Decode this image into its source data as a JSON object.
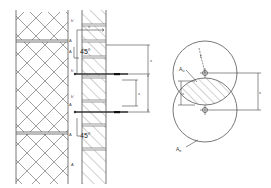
{
  "diagram": {
    "left_section": {
      "angle_labels": [
        "45°",
        "45°"
      ],
      "dimension_labels": {
        "top_spacing": "s",
        "right_vertical": "s",
        "inner_vertical": "s"
      },
      "side_labels": [
        "h'",
        "A",
        "A",
        "h'",
        "h'",
        "A",
        "A",
        "A"
      ]
    },
    "right_section": {
      "radius_label": "r",
      "overlap_label": "A",
      "overlap_sub": "ü",
      "circle_label": "A",
      "circle_sub": "e",
      "left_dim_label": "x",
      "right_dim_label": "s"
    },
    "colors": {
      "line": "#555555",
      "hatch": "#666666",
      "anchor_tip": "#111111",
      "background": "#ffffff"
    }
  }
}
